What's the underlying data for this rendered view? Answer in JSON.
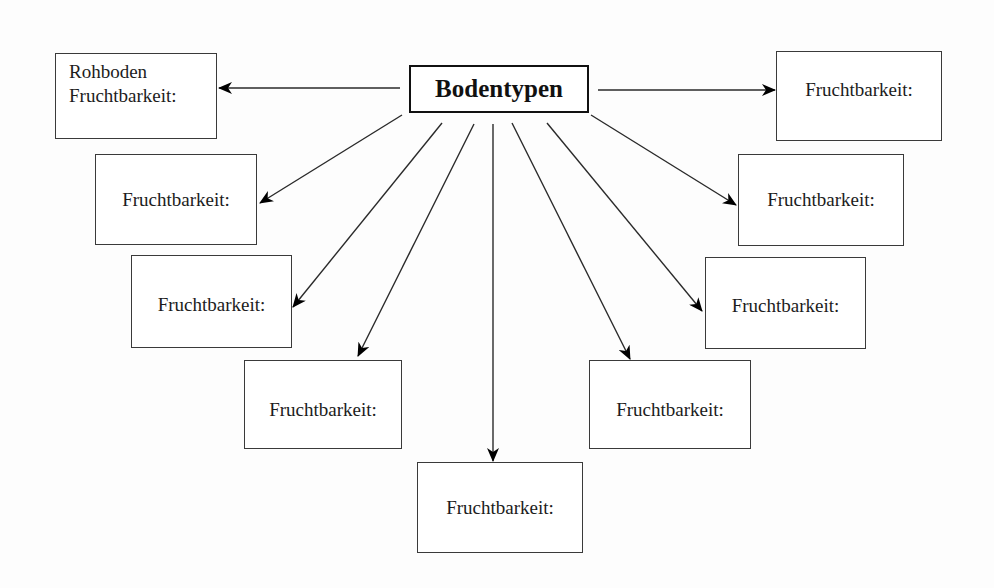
{
  "diagram": {
    "center": {
      "label": "Bodentypen"
    },
    "boxes": [
      {
        "id": "top-left",
        "line1": "Rohboden",
        "line2": "Fruchtbarkeit:"
      },
      {
        "id": "left-2",
        "label": "Fruchtbarkeit:"
      },
      {
        "id": "left-3",
        "label": "Fruchtbarkeit:"
      },
      {
        "id": "left-4",
        "label": "Fruchtbarkeit:"
      },
      {
        "id": "bottom-center",
        "label": "Fruchtbarkeit:"
      },
      {
        "id": "right-4",
        "label": "Fruchtbarkeit:"
      },
      {
        "id": "right-3",
        "label": "Fruchtbarkeit:"
      },
      {
        "id": "right-2",
        "label": "Fruchtbarkeit:"
      },
      {
        "id": "top-right",
        "label": "Fruchtbarkeit:"
      }
    ],
    "colors": {
      "line": "#2a2a2a",
      "arrowhead": "#000000",
      "box_border": "#3a3a3a",
      "center_border": "#111111"
    }
  }
}
